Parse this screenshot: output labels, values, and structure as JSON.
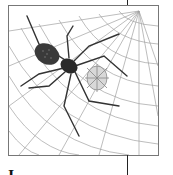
{
  "page": {
    "illustration": {
      "subject": "spider-on-web",
      "description": "Engraved illustration of a large spider on a web with a smaller web-wrapped insect"
    },
    "caption_partial": "I"
  },
  "colors": {
    "frame_border": "#777777",
    "ink": "#222222",
    "web": "#9a9a9a",
    "background": "#ffffff"
  }
}
